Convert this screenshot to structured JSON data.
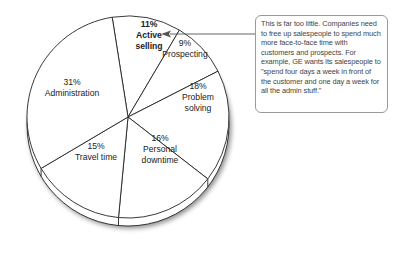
{
  "chart_data": {
    "type": "pie",
    "title": "",
    "slices": [
      {
        "label": "Active selling",
        "value": 11,
        "pct_text": "11%",
        "lines": [
          "Active",
          "selling"
        ],
        "bold": true
      },
      {
        "label": "Prospecting",
        "value": 9,
        "pct_text": "9%",
        "lines": [
          "Prospecting"
        ],
        "bold": false
      },
      {
        "label": "Problem solving",
        "value": 18,
        "pct_text": "18%",
        "lines": [
          "Problem",
          "solving"
        ],
        "bold": false
      },
      {
        "label": "Personal downtime",
        "value": 16,
        "pct_text": "16%",
        "lines": [
          "Personal",
          "downtime"
        ],
        "bold": false
      },
      {
        "label": "Travel time",
        "value": 15,
        "pct_text": "15%",
        "lines": [
          "Travel time"
        ],
        "bold": false
      },
      {
        "label": "Administration",
        "value": 31,
        "pct_text": "31%",
        "lines": [
          "Administration"
        ],
        "bold": false
      }
    ],
    "style": "3d-tilted pie, white fill, black outlines"
  },
  "callout": {
    "text": "This is far too little. Companies need to free up salespeople to spend much more face-to-face time with customers and prospects. For example, GE wants its salespeople to \"spend four days a week in front of the customer and one day a week for all the admin stuff.\"",
    "points_to": "Active selling"
  },
  "colors": {
    "fill": "#ffffff",
    "stroke": "#222222",
    "callout_border": "#9a9a9a",
    "arrow": "#555555"
  }
}
